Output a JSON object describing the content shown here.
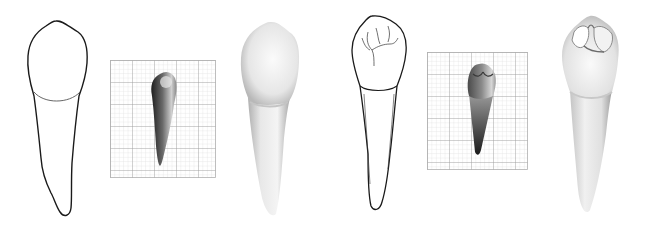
{
  "figure": {
    "background": "#ffffff"
  },
  "panels": [
    {
      "id": "outline-drawing-1",
      "kind": "line-drawing",
      "view": "buccal",
      "x": 24,
      "y": 18,
      "w": 68,
      "h": 203
    },
    {
      "id": "grid-photo-1",
      "kind": "photo-on-grid",
      "view": "buccal",
      "x": 110,
      "y": 60,
      "w": 106,
      "h": 118,
      "grid": {
        "major_px": 22,
        "minor_div": 5,
        "major_color": "#9a9a9a",
        "minor_color": "#d4d4d4"
      }
    },
    {
      "id": "shaded-render-1",
      "kind": "shaded-rendering",
      "view": "buccal",
      "x": 236,
      "y": 18,
      "w": 68,
      "h": 200
    },
    {
      "id": "outline-drawing-2",
      "kind": "line-drawing",
      "view": "occlusal-oblique",
      "x": 344,
      "y": 14,
      "w": 68,
      "h": 196
    },
    {
      "id": "grid-photo-2",
      "kind": "photo-on-grid",
      "view": "occlusal-oblique",
      "x": 427,
      "y": 52,
      "w": 101,
      "h": 118,
      "grid": {
        "major_px": 22,
        "minor_div": 5,
        "major_color": "#9a9a9a",
        "minor_color": "#d4d4d4"
      }
    },
    {
      "id": "shaded-render-2",
      "kind": "shaded-rendering",
      "view": "occlusal-oblique",
      "x": 560,
      "y": 14,
      "w": 66,
      "h": 203
    }
  ],
  "colors": {
    "outline": "#1a1a1a",
    "cej_line": "#555555",
    "render_light": "#f4f4f4",
    "render_mid": "#d8d8d8",
    "render_dark": "#a8a8a8",
    "photo_dark": "#2a2a2a",
    "photo_light": "#e8e8e8"
  }
}
